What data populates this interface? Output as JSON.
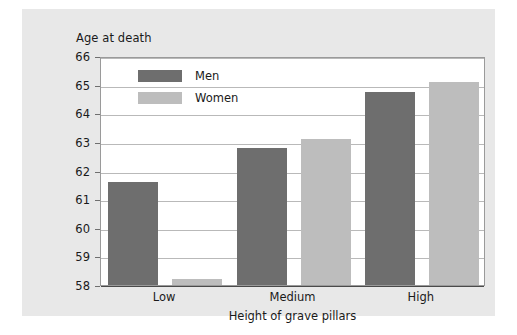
{
  "chart_data": {
    "type": "bar",
    "title": "",
    "ylabel": "Age at death",
    "xlabel": "Height of grave pillars",
    "categories": [
      "Low",
      "Medium",
      "High"
    ],
    "series": [
      {
        "name": "Men",
        "color": "#6e6e6e",
        "values": [
          61.6,
          62.8,
          64.75
        ]
      },
      {
        "name": "Women",
        "color": "#bdbdbd",
        "values": [
          58.2,
          63.1,
          65.1
        ]
      }
    ],
    "ylim": [
      58,
      66
    ],
    "yticks": [
      58,
      59,
      60,
      61,
      62,
      63,
      64,
      65,
      66
    ],
    "ytick_labels": [
      "58",
      "59",
      "60",
      "61",
      "62",
      "63",
      "64",
      "65",
      "66"
    ],
    "grid": true,
    "legend_position": "top-left-inside",
    "legend_entries": [
      "Men",
      "Women"
    ]
  },
  "figure": {
    "background_color": "#e8e8e8",
    "plot_background_color": "#ffffff",
    "gridline_color": "#b9b9b9",
    "axis_color": "#9a9a9a"
  }
}
